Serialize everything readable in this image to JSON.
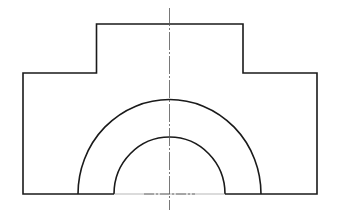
{
  "drawing": {
    "type": "orthographic-view",
    "colors": {
      "background": "#ffffff",
      "outline": "#1a1a1a",
      "centerline": "#555555"
    },
    "outline_path": "M23,194 L23,73 L96.5,73 L96.5,24 L243,24 L243,73 L317,73 L317,194 L261,194 A91.5,94 0 0 0 78,194 Z",
    "bottom_inner_segment": {
      "x1": 114,
      "x2": 225,
      "y": 194
    },
    "outer_arc": {
      "cx": 169.5,
      "cy": 194,
      "rx": 91.5,
      "ry": 94.5
    },
    "inner_arc": {
      "cx": 169.5,
      "cy": 194,
      "rx": 55.5,
      "ry": 57
    },
    "centerline_vertical": {
      "x": 169.5,
      "y1": 8,
      "y2": 210
    },
    "centerline_horizontal": {
      "y": 194,
      "x1": 140,
      "x2": 200
    }
  }
}
